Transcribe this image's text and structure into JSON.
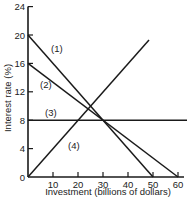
{
  "chart_data": {
    "type": "line",
    "title": "",
    "xlabel": "Investment (billions of dollars)",
    "ylabel": "Interest rate (%)",
    "xlim": [
      0,
      60
    ],
    "ylim": [
      0,
      24
    ],
    "x_ticks": [
      10,
      20,
      30,
      40,
      50,
      60
    ],
    "y_ticks": [
      0,
      4,
      8,
      12,
      16,
      20,
      24
    ],
    "grid": false,
    "legend": "none (inline labels)",
    "series": [
      {
        "name": "(1)",
        "points": [
          [
            0,
            20
          ],
          [
            50,
            0
          ]
        ],
        "label_pos": [
          9.2,
          17.6
        ]
      },
      {
        "name": "(2)",
        "points": [
          [
            0,
            16
          ],
          [
            60,
            0
          ]
        ],
        "label_pos": [
          4.8,
          12.5
        ]
      },
      {
        "name": "(3)",
        "points": [
          [
            0,
            8
          ],
          [
            63.6,
            8
          ]
        ],
        "label_pos": [
          6.8,
          8.6
        ]
      },
      {
        "name": "(4)",
        "points": [
          [
            0,
            0
          ],
          [
            48.4,
            19.3
          ]
        ],
        "label_pos": [
          16,
          4
        ]
      }
    ]
  }
}
